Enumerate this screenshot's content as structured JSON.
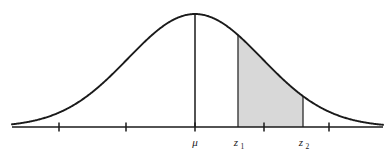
{
  "figure": {
    "kind": "normal-distribution-curve-diagram",
    "background_color": "#ffffff",
    "curve_color": "#1a1a1a",
    "axis_color": "#1a1a1a",
    "shade_color": "#d8d8d8",
    "shade_border_color": "#4a4a4a"
  },
  "labels": {
    "mean": {
      "symbol": "μ",
      "subscript": "",
      "x": 195
    },
    "z1": {
      "symbol": "z",
      "subscript": "1",
      "x": 238
    },
    "z2": {
      "symbol": "z",
      "subscript": "2",
      "x": 303
    }
  },
  "axis": {
    "baseline_y": 127,
    "x_start": 12,
    "x_end": 383,
    "tick_positions": [
      59,
      126,
      195,
      264,
      329
    ],
    "tick_height": 9
  },
  "curve": {
    "peak_x": 195,
    "peak_y": 14,
    "sigma_px": 67,
    "mean_line_top_y": 14,
    "mean_line_bottom_y": 127
  },
  "shaded_region": {
    "from_label": "z1",
    "to_label": "z2",
    "x_left": 238,
    "x_right": 303,
    "fill": "#d8d8d8"
  }
}
